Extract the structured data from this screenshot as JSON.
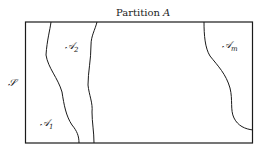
{
  "diagram": {
    "title": "Partition A",
    "title_main": "Partition ",
    "title_var": "A",
    "set_label": "𝒮",
    "regions": [
      {
        "symbol": "𝒜",
        "subscript": "1"
      },
      {
        "symbol": "𝒜",
        "subscript": "2"
      },
      {
        "symbol": "𝒜",
        "subscript": "m"
      }
    ],
    "colors": {
      "stroke": "#1a1a1a",
      "background": "#ffffff"
    }
  }
}
